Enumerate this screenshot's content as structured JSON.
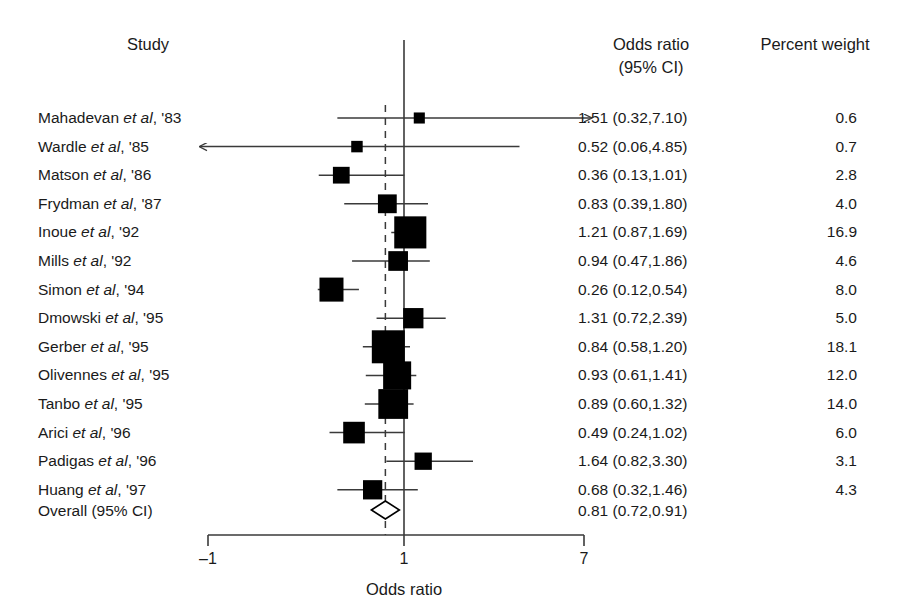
{
  "headers": {
    "study": "Study",
    "odds_ratio_line1": "Odds ratio",
    "odds_ratio_line2": "(95% CI)",
    "percent_weight": "Percent weight"
  },
  "axis": {
    "label": "Odds ratio",
    "ticks": [
      "–1",
      "1",
      "7"
    ],
    "tick_values": [
      -1,
      1,
      7
    ],
    "reference_value": 1
  },
  "overall": {
    "label": "Overall (95% CI)",
    "estimate_text": "0.81 (0.72,0.91)",
    "estimate": 0.81,
    "ci_low": 0.72,
    "ci_high": 0.91
  },
  "colors": {
    "marker": "#000000",
    "line": "#3a3a3a",
    "axis": "#3a3a3a",
    "text": "#1a1a1a",
    "background": "#ffffff"
  },
  "chart_data": {
    "type": "forest",
    "title": "",
    "xlabel": "Odds ratio",
    "ylabel": "",
    "xlim": [
      -1,
      7
    ],
    "reference_line": 1,
    "pooled_line": 0.81,
    "grid": false,
    "columns": [
      "Study",
      "Odds ratio (95% CI)",
      "Percent weight"
    ],
    "rows": [
      {
        "study": "Mahadevan",
        "etal": "et al",
        "year": "'83",
        "label": "Mahadevan et al, '83",
        "or": 1.51,
        "ci_low": 0.32,
        "ci_high": 7.1,
        "or_text": "1.51 (0.32,7.10)",
        "weight": 0.6,
        "weight_text": "0.6",
        "clipped_right": true,
        "clipped_left": false
      },
      {
        "study": "Wardle",
        "etal": "et al",
        "year": "'85",
        "label": "Wardle et al, '85",
        "or": 0.52,
        "ci_low": 0.06,
        "ci_high": 4.85,
        "or_text": "0.52 (0.06,4.85)",
        "weight": 0.7,
        "weight_text": "0.7",
        "clipped_right": false,
        "clipped_left": true
      },
      {
        "study": "Matson",
        "etal": "et al",
        "year": "'86",
        "label": "Matson et al, '86",
        "or": 0.36,
        "ci_low": 0.13,
        "ci_high": 1.01,
        "or_text": "0.36 (0.13,1.01)",
        "weight": 2.8,
        "weight_text": "2.8",
        "clipped_right": false,
        "clipped_left": false
      },
      {
        "study": "Frydman",
        "etal": "et al",
        "year": "'87",
        "label": "Frydman et al, '87",
        "or": 0.83,
        "ci_low": 0.39,
        "ci_high": 1.8,
        "or_text": "0.83 (0.39,1.80)",
        "weight": 4.0,
        "weight_text": "4.0",
        "clipped_right": false,
        "clipped_left": false
      },
      {
        "study": "Inoue",
        "etal": "et al",
        "year": "'92",
        "label": "Inoue et al, '92",
        "or": 1.21,
        "ci_low": 0.87,
        "ci_high": 1.69,
        "or_text": "1.21 (0.87,1.69)",
        "weight": 16.9,
        "weight_text": "16.9",
        "clipped_right": false,
        "clipped_left": false
      },
      {
        "study": "Mills",
        "etal": "et al",
        "year": "'92",
        "label": "Mills et al, '92",
        "or": 0.94,
        "ci_low": 0.47,
        "ci_high": 1.86,
        "or_text": "0.94 (0.47,1.86)",
        "weight": 4.6,
        "weight_text": "4.6",
        "clipped_right": false,
        "clipped_left": false
      },
      {
        "study": "Simon",
        "etal": "et al",
        "year": "'94",
        "label": "Simon et al, '94",
        "or": 0.26,
        "ci_low": 0.12,
        "ci_high": 0.54,
        "or_text": "0.26 (0.12,0.54)",
        "weight": 8.0,
        "weight_text": "8.0",
        "clipped_right": false,
        "clipped_left": false
      },
      {
        "study": "Dmowski",
        "etal": "et al",
        "year": "'95",
        "label": "Dmowski et al, '95",
        "or": 1.31,
        "ci_low": 0.72,
        "ci_high": 2.39,
        "or_text": "1.31 (0.72,2.39)",
        "weight": 5.0,
        "weight_text": "5.0",
        "clipped_right": false,
        "clipped_left": false
      },
      {
        "study": "Gerber",
        "etal": "et al",
        "year": "'95",
        "label": "Gerber et al, '95",
        "or": 0.84,
        "ci_low": 0.58,
        "ci_high": 1.2,
        "or_text": "0.84 (0.58,1.20)",
        "weight": 18.1,
        "weight_text": "18.1",
        "clipped_right": false,
        "clipped_left": false
      },
      {
        "study": "Olivennes",
        "etal": "et al",
        "year": "'95",
        "label": "Olivennes et al, '95",
        "or": 0.93,
        "ci_low": 0.61,
        "ci_high": 1.41,
        "or_text": "0.93 (0.61,1.41)",
        "weight": 12.0,
        "weight_text": "12.0",
        "clipped_right": false,
        "clipped_left": false
      },
      {
        "study": "Tanbo",
        "etal": "et al",
        "year": "'95",
        "label": "Tanbo et al, '95",
        "or": 0.89,
        "ci_low": 0.6,
        "ci_high": 1.32,
        "or_text": "0.89 (0.60,1.32)",
        "weight": 14.0,
        "weight_text": "14.0",
        "clipped_right": false,
        "clipped_left": false
      },
      {
        "study": "Arici",
        "etal": "et al",
        "year": "'96",
        "label": "Arici et al, '96",
        "or": 0.49,
        "ci_low": 0.24,
        "ci_high": 1.02,
        "or_text": "0.49 (0.24,1.02)",
        "weight": 6.0,
        "weight_text": "6.0",
        "clipped_right": false,
        "clipped_left": false
      },
      {
        "study": "Padigas",
        "etal": "et al",
        "year": "'96",
        "label": "Padigas et al, '96",
        "or": 1.64,
        "ci_low": 0.82,
        "ci_high": 3.3,
        "or_text": "1.64 (0.82,3.30)",
        "weight": 3.1,
        "weight_text": "3.1",
        "clipped_right": false,
        "clipped_left": false
      },
      {
        "study": "Huang",
        "etal": "et al",
        "year": "'97",
        "label": "Huang et al, '97",
        "or": 0.68,
        "ci_low": 0.32,
        "ci_high": 1.46,
        "or_text": "0.68 (0.32,1.46)",
        "weight": 4.3,
        "weight_text": "4.3",
        "clipped_right": false,
        "clipped_left": false
      }
    ],
    "summary": {
      "label": "Overall (95% CI)",
      "or": 0.81,
      "ci_low": 0.72,
      "ci_high": 0.91,
      "or_text": "0.81 (0.72,0.91)"
    }
  }
}
